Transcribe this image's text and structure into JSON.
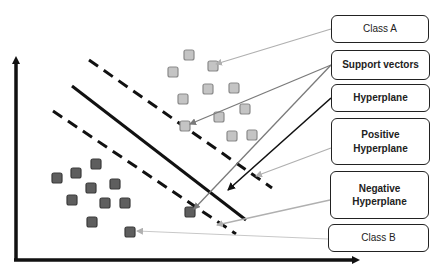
{
  "diagram": {
    "labels": [
      {
        "id": "class-a",
        "text": "Class A",
        "x": 331,
        "y": 15,
        "w": 98,
        "h": 28,
        "bold": false
      },
      {
        "id": "support-vectors",
        "text": "Support vectors",
        "x": 331,
        "y": 50,
        "w": 99,
        "h": 30,
        "bold": true
      },
      {
        "id": "hyperplane",
        "text": "Hyperplane",
        "x": 331,
        "y": 84,
        "w": 99,
        "h": 28,
        "bold": true
      },
      {
        "id": "positive-hyperplane",
        "text": "Positive\nHyperplane",
        "x": 331,
        "y": 118,
        "w": 99,
        "h": 47,
        "bold": true
      },
      {
        "id": "negative-hyperplane",
        "text": "Negative\nHyperplane",
        "x": 330,
        "y": 171,
        "w": 99,
        "h": 48,
        "bold": true
      },
      {
        "id": "class-b",
        "text": "Class B",
        "x": 328,
        "y": 224,
        "w": 101,
        "h": 28,
        "bold": false
      }
    ],
    "colors": {
      "class_a_fill": "#c4c4c4",
      "class_a_stroke": "#8a8a8a",
      "class_b_fill": "#5e5e5e",
      "class_b_stroke": "#3a3a3a",
      "line": "#111111",
      "pointer_light": "#b0b0b0",
      "pointer_mid": "#7a7a7a"
    },
    "class_a_points": [
      [
        189,
        55
      ],
      [
        173,
        72
      ],
      [
        213,
        66
      ],
      [
        183,
        99
      ],
      [
        208,
        89
      ],
      [
        234,
        88
      ],
      [
        219,
        117
      ],
      [
        245,
        109
      ],
      [
        232,
        136
      ],
      [
        252,
        135
      ],
      [
        185,
        126
      ]
    ],
    "class_b_points": [
      [
        96,
        164
      ],
      [
        57,
        178
      ],
      [
        76,
        173
      ],
      [
        91,
        188
      ],
      [
        115,
        184
      ],
      [
        72,
        200
      ],
      [
        105,
        203
      ],
      [
        125,
        203
      ],
      [
        92,
        222
      ],
      [
        130,
        232
      ],
      [
        190,
        212
      ]
    ]
  }
}
